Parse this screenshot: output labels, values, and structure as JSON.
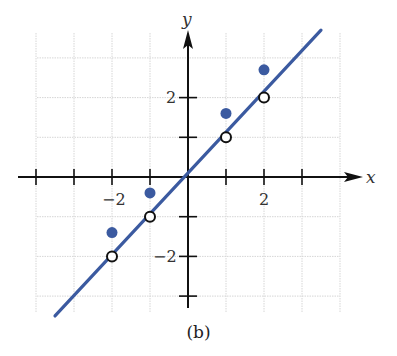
{
  "chart_data": {
    "type": "scatter",
    "title": "",
    "caption": "(b)",
    "xlabel": "x",
    "ylabel": "y",
    "xlim": [
      -4,
      4
    ],
    "ylim": [
      -3.5,
      3.7
    ],
    "grid": true,
    "x_ticks": [
      -4,
      -3,
      -2,
      -1,
      1,
      2,
      3
    ],
    "y_ticks": [
      -3,
      -2,
      -1,
      1,
      2
    ],
    "x_tick_labels": [
      {
        "value": -2,
        "label": "−2"
      },
      {
        "value": 2,
        "label": "2"
      }
    ],
    "y_tick_labels": [
      {
        "value": -2,
        "label": "−2"
      },
      {
        "value": 2,
        "label": "2"
      }
    ],
    "series": [
      {
        "name": "line y = x",
        "kind": "line",
        "color": "#3b5aa0",
        "x": [
          -3.5,
          3.5
        ],
        "y": [
          -3.5,
          3.7
        ]
      },
      {
        "name": "filled points",
        "kind": "scatter-filled",
        "color": "#3b5aa0",
        "x": [
          -2,
          -1,
          1,
          2
        ],
        "y": [
          -1.4,
          -0.4,
          1.6,
          2.7
        ]
      },
      {
        "name": "open points on line",
        "kind": "scatter-open",
        "color": "#111111",
        "x": [
          -2,
          -1,
          1,
          2
        ],
        "y": [
          -2,
          -1,
          1,
          2
        ]
      }
    ]
  },
  "labels": {
    "x_axis": "x",
    "y_axis": "y",
    "caption": "(b)",
    "x_neg2": "−2",
    "x_pos2": "2",
    "y_neg2": "−2",
    "y_pos2": "2"
  }
}
